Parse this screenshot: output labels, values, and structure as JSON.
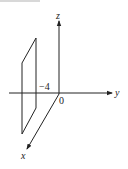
{
  "figure": {
    "axes": {
      "x_label": "x",
      "y_label": "y",
      "z_label": "z"
    },
    "origin_label": "0",
    "plane_intercept_label": "−4",
    "plane": {
      "equation_value": -4,
      "axis": "y"
    }
  }
}
